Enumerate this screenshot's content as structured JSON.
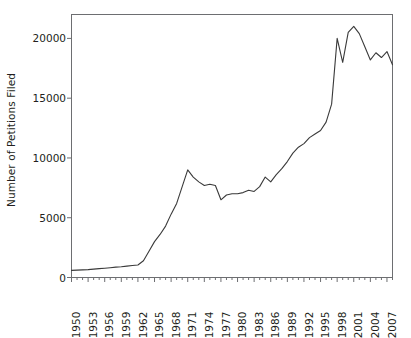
{
  "chart_data": {
    "type": "line",
    "title": "",
    "xlabel": "",
    "ylabel": "Number of Petitions Filed",
    "xlim": [
      1950,
      2008
    ],
    "ylim": [
      0,
      22000
    ],
    "grid": false,
    "legend": null,
    "line_color": "#3a3a3a",
    "axis_color": "#6d6e71",
    "y_ticks": [
      0,
      5000,
      10000,
      15000,
      20000
    ],
    "y_tick_labels": [
      "0",
      "5000",
      "10000",
      "15000",
      "20000"
    ],
    "x_ticks": [
      1950,
      1953,
      1956,
      1959,
      1962,
      1965,
      1968,
      1971,
      1974,
      1977,
      1980,
      1983,
      1986,
      1989,
      1992,
      1995,
      1998,
      2001,
      2004,
      2007
    ],
    "x_tick_labels": [
      "1950",
      "1953",
      "1956",
      "1959",
      "1962",
      "1965",
      "1968",
      "1971",
      "1974",
      "1977",
      "1980",
      "1983",
      "1986",
      "1989",
      "1992",
      "1995",
      "1998",
      "2001",
      "2004",
      "2007"
    ],
    "x_minor_ticks_every": 1,
    "x": [
      1950,
      1951,
      1952,
      1953,
      1954,
      1955,
      1956,
      1957,
      1958,
      1959,
      1960,
      1961,
      1962,
      1963,
      1964,
      1965,
      1966,
      1967,
      1968,
      1969,
      1970,
      1971,
      1972,
      1973,
      1974,
      1975,
      1976,
      1977,
      1978,
      1979,
      1980,
      1981,
      1982,
      1983,
      1984,
      1985,
      1986,
      1987,
      1988,
      1989,
      1990,
      1991,
      1992,
      1993,
      1994,
      1995,
      1996,
      1997,
      1998,
      1999,
      2000,
      2001,
      2002,
      2003,
      2004,
      2005,
      2006,
      2007,
      2008
    ],
    "y": [
      600,
      620,
      640,
      660,
      700,
      740,
      780,
      820,
      870,
      900,
      950,
      1000,
      1050,
      1400,
      2200,
      3000,
      3600,
      4300,
      5300,
      6200,
      7600,
      9000,
      8400,
      8000,
      7700,
      7800,
      7700,
      6500,
      6900,
      7000,
      7000,
      7100,
      7300,
      7200,
      7600,
      8400,
      8000,
      8600,
      9100,
      9700,
      10400,
      10900,
      11200,
      11700,
      12000,
      12300,
      13000,
      14500,
      20000,
      18000,
      20500,
      21000,
      20400,
      19300,
      18200,
      18800,
      18400,
      18900,
      17800
    ]
  },
  "axes": {
    "frame_visible": true,
    "tick_direction": "out"
  }
}
